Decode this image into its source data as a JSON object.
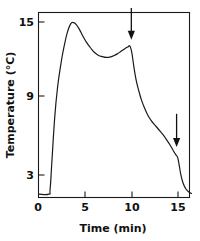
{
  "chart_data": {
    "type": "line",
    "title": "",
    "xlabel": "Time (min)",
    "ylabel": "Temperature (°C)",
    "xlim": [
      0,
      16.5
    ],
    "ylim": [
      0.6,
      16.3
    ],
    "xticks": [
      0,
      5,
      10,
      15
    ],
    "xtick_labels": [
      "0",
      "5",
      "10",
      "15"
    ],
    "yticks": [
      3,
      9,
      15
    ],
    "ytick_labels": [
      "3",
      "9",
      "15"
    ],
    "grid": false,
    "legend": null,
    "series": [
      {
        "name": "Temperature trace",
        "x": [
          0.15,
          1.15,
          1.3,
          1.5,
          1.8,
          2.1,
          2.45,
          2.8,
          3.15,
          3.5,
          3.8,
          4.1,
          4.45,
          4.8,
          5.2,
          5.6,
          6.0,
          6.45,
          6.9,
          7.3,
          7.7,
          8.1,
          8.5,
          8.9,
          9.3,
          9.65,
          9.85,
          10.05,
          10.25,
          10.5,
          10.8,
          11.1,
          11.45,
          11.8,
          12.15,
          12.55,
          12.95,
          13.35,
          13.75,
          14.15,
          14.5,
          14.8,
          14.95,
          15.1,
          15.3,
          15.55,
          15.85,
          16.2,
          16.45
        ],
        "y": [
          1.5,
          1.5,
          1.9,
          4.2,
          7.6,
          9.9,
          11.7,
          13.1,
          14.2,
          14.85,
          14.95,
          14.8,
          14.4,
          13.9,
          13.4,
          13.0,
          12.65,
          12.4,
          12.28,
          12.22,
          12.25,
          12.35,
          12.5,
          12.7,
          12.9,
          13.05,
          13.12,
          12.6,
          11.6,
          10.5,
          9.6,
          8.85,
          8.2,
          7.65,
          7.25,
          6.9,
          6.55,
          6.2,
          5.8,
          5.35,
          4.9,
          4.55,
          4.4,
          3.9,
          3.05,
          2.35,
          1.9,
          1.65,
          1.55
        ]
      }
    ],
    "annotations": [
      {
        "name": "arrow-1",
        "kind": "down-arrow",
        "x": 10.0,
        "y_tip": 13.6,
        "y_tail": 16.1,
        "label": ""
      },
      {
        "name": "arrow-2",
        "kind": "down-arrow",
        "x": 14.85,
        "y_tip": 5.2,
        "y_tail": 7.8,
        "label": ""
      }
    ]
  },
  "axes": {
    "x_title": "Time (min)",
    "y_title": "Temperature (°C)"
  },
  "colors": {
    "curve": "#1a1a1a",
    "frame": "#1a1a1a",
    "text": "#111111",
    "background": "#ffffff"
  }
}
